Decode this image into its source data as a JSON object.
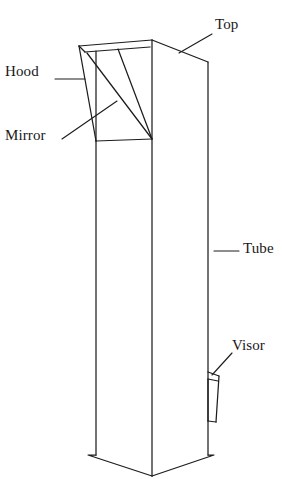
{
  "figure": {
    "background_color": "#ffffff",
    "line_color": "#1d1d1f",
    "width": 282,
    "height": 479
  },
  "labels": {
    "top": "Top",
    "hood": "Hood",
    "mirror": "Mirror",
    "tube": "Tube",
    "visor": "Visor"
  },
  "parts": [
    {
      "name": "top",
      "label": "Top",
      "label_x": 215,
      "label_y": 17,
      "leader_from": [
        212,
        34
      ],
      "leader_to": [
        178,
        52
      ]
    },
    {
      "name": "hood",
      "label": "Hood",
      "label_x": 5,
      "label_y": 64,
      "leader_from": [
        55,
        79
      ],
      "leader_to": [
        84,
        79
      ]
    },
    {
      "name": "mirror",
      "label": "Mirror",
      "label_x": 5,
      "label_y": 128,
      "leader_from": [
        62,
        138
      ],
      "leader_to": [
        116,
        102
      ]
    },
    {
      "name": "tube",
      "label": "Tube",
      "label_x": 243,
      "label_y": 241,
      "leader_from": [
        214,
        251
      ],
      "leader_to": [
        238,
        251
      ]
    },
    {
      "name": "visor",
      "label": "Visor",
      "label_x": 232,
      "label_y": 338,
      "leader_from": [
        213,
        374
      ],
      "leader_to": [
        231,
        353
      ]
    }
  ],
  "geometry": {
    "hood": {
      "apex_left": [
        79,
        46
      ],
      "apex_right": [
        152,
        40
      ],
      "ridge_inner_left": [
        85,
        51
      ],
      "ridge_inner_right": [
        150,
        47
      ],
      "base_left": [
        96,
        141
      ],
      "base_right": [
        152,
        139
      ],
      "mirror_diagonals": [
        [
          [
            87,
            52
          ],
          [
            152,
            139
          ]
        ],
        [
          [
            118,
            50
          ],
          [
            152,
            139
          ]
        ]
      ],
      "left_slant": [
        [
          79,
          46
        ],
        [
          96,
          141
        ]
      ],
      "inner_vertical": [
        [
          96,
          51
        ],
        [
          96,
          141
        ]
      ]
    },
    "top_face": {
      "peak": [
        152,
        40
      ],
      "right_end": [
        208,
        62
      ],
      "right_edge_bottom": [
        208,
        455
      ]
    },
    "tube": {
      "left_edge_x": 96,
      "middle_edge_x": 152,
      "right_edge_x": 208,
      "top_y": 141,
      "bottom_y": 455,
      "bottom_left_corner": [
        88,
        455
      ],
      "bottom_center": [
        152,
        476
      ],
      "bottom_right_corner": [
        214,
        455
      ]
    },
    "visor": {
      "top_y": 372,
      "bottom_y": 422,
      "left_x": 199,
      "right_x": 219
    }
  }
}
